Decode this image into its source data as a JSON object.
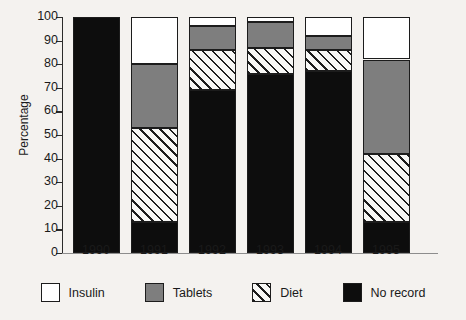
{
  "chart_data": {
    "type": "bar",
    "subtype": "stacked-bar-100",
    "title": "",
    "xlabel": "",
    "ylabel": "Percentage",
    "ylim": [
      0,
      100
    ],
    "yticks": [
      0,
      10,
      20,
      30,
      40,
      50,
      60,
      70,
      80,
      90,
      100
    ],
    "ytick_labels": [
      "0",
      "10",
      "20",
      "30",
      "40",
      "50",
      "60",
      "70",
      "80",
      "90",
      "100"
    ],
    "categories": [
      "1990",
      "1991",
      "1992",
      "1993",
      "1994",
      "1995"
    ],
    "grid": false,
    "legend_position": "bottom",
    "stack_order_bottom_to_top": [
      "No record",
      "Diet",
      "Tablets",
      "Insulin"
    ],
    "series": [
      {
        "name": "No record",
        "key": "norecord",
        "color": "#0d0d0d",
        "fill": "solid-black",
        "values": [
          100,
          13,
          69,
          76,
          77,
          13
        ]
      },
      {
        "name": "Diet",
        "key": "diet",
        "color": "#ffffff",
        "fill": "diagonal-hatch",
        "values": [
          0,
          40,
          17,
          11,
          9,
          29
        ]
      },
      {
        "name": "Tablets",
        "key": "tablets",
        "color": "#7e7e7e",
        "fill": "solid-gray",
        "values": [
          0,
          27,
          10,
          11,
          6,
          40
        ]
      },
      {
        "name": "Insulin",
        "key": "insulin",
        "color": "#ffffff",
        "fill": "solid-white",
        "values": [
          0,
          20,
          4,
          2,
          8,
          18
        ]
      }
    ],
    "cumulative_tops": {
      "1990": {
        "norecord": 100,
        "diet": 100,
        "tablets": 100,
        "insulin": 100
      },
      "1991": {
        "norecord": 13,
        "diet": 53,
        "tablets": 80,
        "insulin": 100
      },
      "1992": {
        "norecord": 69,
        "diet": 86,
        "tablets": 96,
        "insulin": 100
      },
      "1993": {
        "norecord": 76,
        "diet": 87,
        "tablets": 98,
        "insulin": 100
      },
      "1994": {
        "norecord": 77,
        "diet": 86,
        "tablets": 92,
        "insulin": 100
      },
      "1995": {
        "norecord": 13,
        "diet": 42,
        "tablets": 82,
        "insulin": 100
      }
    }
  },
  "axis": {
    "y_title": "Percentage"
  },
  "legend": {
    "items": [
      {
        "label": "Insulin",
        "key": "insulin"
      },
      {
        "label": "Tablets",
        "key": "tablets"
      },
      {
        "label": "Diet",
        "key": "diet"
      },
      {
        "label": "No record",
        "key": "norecord"
      }
    ]
  },
  "colors": {
    "background": "#f4f2ef",
    "ink": "#1a1a1a",
    "outline": "#1c1c1c",
    "gray": "#7e7e7e",
    "black": "#0d0d0d",
    "white": "#ffffff",
    "axis": "#2b2b2b",
    "xaxis": "#8d8d8d"
  }
}
